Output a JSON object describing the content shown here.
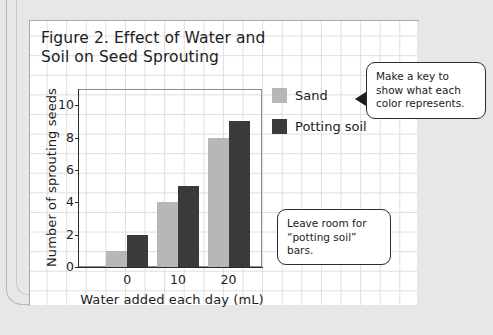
{
  "figure": {
    "title": "Figure 2. Effect of Water and\nSoil on Seed Sprouting"
  },
  "legend": {
    "items": [
      {
        "label": "Sand",
        "color": "#b7b7b7"
      },
      {
        "label": "Potting soil",
        "color": "#3a3a3a"
      }
    ]
  },
  "callouts": [
    {
      "id": "key",
      "text": "Make a key to\nshow what each\ncolor represents."
    },
    {
      "id": "room",
      "text": "Leave room for\n“potting soil” bars."
    }
  ],
  "chart_data": {
    "type": "bar",
    "title": "Figure 2. Effect of Water and Soil on Seed Sprouting",
    "xlabel": "Water added each day (mL)",
    "ylabel": "Number of sprouting seeds",
    "categories": [
      "0",
      "10",
      "20"
    ],
    "series": [
      {
        "name": "Sand",
        "color": "#b7b7b7",
        "values": [
          1,
          4,
          8
        ]
      },
      {
        "name": "Potting soil",
        "color": "#3a3a3a",
        "values": [
          2,
          5,
          9
        ]
      }
    ],
    "ylim": [
      0,
      11
    ],
    "yticks": [
      0,
      2,
      4,
      6,
      8,
      10
    ],
    "ytick_labels": [
      "0",
      "2",
      "4",
      "6",
      "8",
      "10"
    ],
    "grid": false,
    "legend_position": "right"
  }
}
